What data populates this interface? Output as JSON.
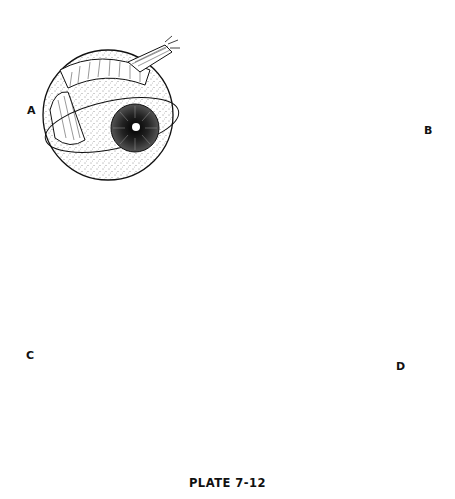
{
  "plate": {
    "caption": "PLATE 7-12",
    "colors": {
      "ink": "#111111",
      "background": "#ffffff"
    }
  },
  "panels": [
    {
      "label": "A",
      "description": "eyeball with rectus muscle and encircling suture"
    },
    {
      "label": "B",
      "description": "muscle hook elevating rectus muscle"
    },
    {
      "label": "C",
      "description": "two hooks isolating muscle belly"
    },
    {
      "label": "D",
      "description": "clamp applied to muscle with hook retraction"
    }
  ]
}
